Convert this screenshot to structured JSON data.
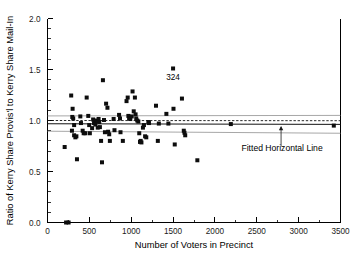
{
  "chart_data": {
    "type": "scatter",
    "title": "",
    "xlabel": "Number of Voters in Precinct",
    "ylabel": "Ratio of Kerry Share Provis'l to Kerry Share Mail-In",
    "xlim": [
      0,
      3500
    ],
    "ylim": [
      0.0,
      2.0
    ],
    "x_ticks": [
      0,
      500,
      1000,
      1500,
      2000,
      2500,
      3000,
      3500
    ],
    "x_tick_labels": [
      "0",
      "500",
      "1000",
      "1500",
      "2000",
      "2500",
      "3000",
      "3500"
    ],
    "x_minor_interval": 250,
    "y_ticks": [
      0.0,
      0.5,
      1.0,
      1.5,
      2.0
    ],
    "y_tick_labels": [
      "0.0",
      "0.5",
      "1.0",
      "1.5",
      "2.0"
    ],
    "y_minor_interval": 0.1,
    "grid": false,
    "legend": "none",
    "marker_style": "filled-square",
    "marker_color": "#0d0d0d",
    "points": [
      [
        222,
        0.0
      ],
      [
        252,
        0.0
      ],
      [
        205,
        0.74
      ],
      [
        283,
        1.245
      ],
      [
        300,
        1.115
      ],
      [
        296,
        1.035
      ],
      [
        307,
        1.02
      ],
      [
        318,
        0.955
      ],
      [
        292,
        0.9
      ],
      [
        318,
        0.855
      ],
      [
        333,
        0.835
      ],
      [
        345,
        0.845
      ],
      [
        352,
        0.62
      ],
      [
        392,
        1.04
      ],
      [
        400,
        0.975
      ],
      [
        420,
        0.9
      ],
      [
        432,
        0.875
      ],
      [
        452,
        0.875
      ],
      [
        468,
        1.225
      ],
      [
        487,
        1.045
      ],
      [
        498,
        0.955
      ],
      [
        506,
        0.875
      ],
      [
        533,
        0.925
      ],
      [
        545,
        1.01
      ],
      [
        556,
        0.975
      ],
      [
        566,
        0.985
      ],
      [
        572,
        0.96
      ],
      [
        580,
        1.0
      ],
      [
        592,
        0.995
      ],
      [
        600,
        0.93
      ],
      [
        610,
        1.015
      ],
      [
        618,
        0.985
      ],
      [
        626,
        0.935
      ],
      [
        640,
        0.8
      ],
      [
        651,
        0.59
      ],
      [
        662,
        1.395
      ],
      [
        675,
        1.005
      ],
      [
        686,
        0.885
      ],
      [
        700,
        1.165
      ],
      [
        716,
        1.125
      ],
      [
        724,
        0.89
      ],
      [
        737,
        0.865
      ],
      [
        745,
        0.8
      ],
      [
        790,
        1.015
      ],
      [
        800,
        0.905
      ],
      [
        855,
        1.055
      ],
      [
        866,
        1.02
      ],
      [
        872,
        0.885
      ],
      [
        900,
        0.8
      ],
      [
        944,
        1.19
      ],
      [
        958,
        1.225
      ],
      [
        966,
        1.045
      ],
      [
        975,
        1.02
      ],
      [
        989,
        1.015
      ],
      [
        1006,
        1.04
      ],
      [
        1016,
        1.285
      ],
      [
        1030,
        1.09
      ],
      [
        1044,
        1.225
      ],
      [
        1052,
        1.06
      ],
      [
        1060,
        1.02
      ],
      [
        1072,
        1.0
      ],
      [
        1085,
        0.99
      ],
      [
        1096,
        0.875
      ],
      [
        1105,
        0.79
      ],
      [
        1113,
        0.8
      ],
      [
        1122,
        0.785
      ],
      [
        1140,
        0.93
      ],
      [
        1152,
        0.955
      ],
      [
        1166,
        0.845
      ],
      [
        1180,
        0.835
      ],
      [
        1205,
        0.985
      ],
      [
        1212,
        0.975
      ],
      [
        1296,
        1.145
      ],
      [
        1318,
        0.8
      ],
      [
        1330,
        0.97
      ],
      [
        1420,
        1.065
      ],
      [
        1444,
        0.97
      ],
      [
        1500,
        1.51
      ],
      [
        1505,
        1.115
      ],
      [
        1520,
        0.765
      ],
      [
        1606,
        1.215
      ],
      [
        1628,
        0.9
      ],
      [
        1636,
        0.88
      ],
      [
        1645,
        0.855
      ],
      [
        1790,
        0.61
      ],
      [
        2190,
        0.965
      ],
      [
        3420,
        0.95
      ]
    ],
    "fitted_line": {
      "name": "Fitted Horizontal Line",
      "style": "solid",
      "y_at_xmin": 0.968,
      "y_at_xmax": 0.962
    },
    "reference_line": {
      "name": "Unity reference",
      "style": "dashed",
      "y_at_xmin": 1.0,
      "y_at_xmax": 0.998
    },
    "confidence_band": {
      "name": "Confidence band",
      "upper_at_xmin": 1.045,
      "upper_at_xmax": 1.05,
      "lower_at_xmin": 0.895,
      "lower_at_xmax": 0.875
    },
    "annotations": [
      {
        "name": "outlier-label",
        "text": "324",
        "x": 1500,
        "y": 1.4
      },
      {
        "name": "fitted-line-callout",
        "text": "Fitted Horizontal Line",
        "x": 2790,
        "y": 0.7,
        "points_to_x": 2790,
        "points_to_y": 0.962
      }
    ]
  }
}
